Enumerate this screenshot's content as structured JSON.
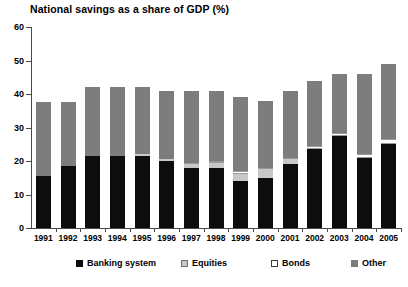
{
  "chart_data": {
    "type": "bar",
    "stacked": true,
    "title": "National savings as a share of GDP (%)",
    "xlabel": "",
    "ylabel": "",
    "ylim": [
      0,
      60
    ],
    "yticks": [
      0,
      10,
      20,
      30,
      40,
      50,
      60
    ],
    "grid": false,
    "legend_position": "bottom",
    "categories": [
      "1991",
      "1992",
      "1993",
      "1994",
      "1995",
      "1996",
      "1997",
      "1998",
      "1999",
      "2000",
      "2001",
      "2002",
      "2003",
      "2004",
      "2005"
    ],
    "series": [
      {
        "name": "Banking system",
        "color": "#0d0d0d",
        "values": [
          15.5,
          18.5,
          21.5,
          21.5,
          21.5,
          20.0,
          18.0,
          18.0,
          14.0,
          15.0,
          19.0,
          23.5,
          27.5,
          21.0,
          25.0
        ]
      },
      {
        "name": "Equities",
        "color": "#c8c8c8",
        "values": [
          0.0,
          0.0,
          0.0,
          0.0,
          0.5,
          0.5,
          1.0,
          1.5,
          2.0,
          2.5,
          1.5,
          0.0,
          0.0,
          0.0,
          0.0
        ]
      },
      {
        "name": "Bonds",
        "color": "#ffffff",
        "values": [
          0.0,
          0.0,
          0.0,
          0.0,
          0.0,
          0.0,
          0.5,
          0.5,
          1.0,
          0.5,
          0.5,
          1.0,
          1.0,
          1.0,
          1.5
        ]
      },
      {
        "name": "Other",
        "color": "#7d7d7d",
        "values": [
          22.0,
          19.0,
          20.5,
          20.5,
          20.0,
          20.5,
          21.5,
          21.0,
          22.0,
          20.0,
          20.0,
          19.5,
          17.5,
          24.0,
          22.5
        ]
      }
    ],
    "totals": [
      37.5,
      37.5,
      42.0,
      42.0,
      42.0,
      41.0,
      41.0,
      41.0,
      39.0,
      38.0,
      41.0,
      44.0,
      46.0,
      46.0,
      49.0
    ]
  },
  "legend": {
    "items": [
      {
        "label": "Banking system",
        "swatch": "banking"
      },
      {
        "label": "Equities",
        "swatch": "equities"
      },
      {
        "label": "Bonds",
        "swatch": "bonds"
      },
      {
        "label": "Other",
        "swatch": "other"
      }
    ]
  }
}
